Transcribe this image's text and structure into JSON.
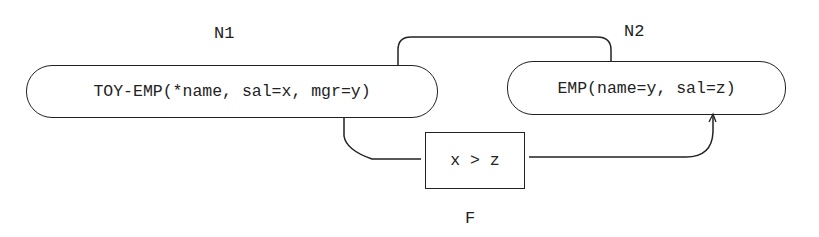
{
  "diagram": {
    "nodes": [
      {
        "id": "N1",
        "label": "N1",
        "text": "TOY-EMP(*name, sal=x, mgr=y)"
      },
      {
        "id": "N2",
        "label": "N2",
        "text": "EMP(name=y, sal=z)"
      }
    ],
    "filter": {
      "id": "F",
      "label": "F",
      "text": "x > z"
    },
    "edges": [
      {
        "from": "N1",
        "to": "N2",
        "route": "top"
      },
      {
        "from": "N1",
        "to": "N2",
        "route": "bottom",
        "via": "F"
      }
    ],
    "colors": {
      "line": "#222222",
      "background": "#ffffff"
    }
  }
}
